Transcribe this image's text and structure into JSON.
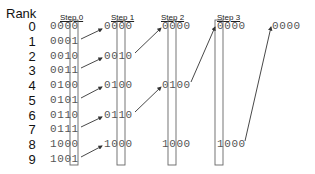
{
  "diagram": {
    "title": "Rank",
    "ranks": [
      "0",
      "1",
      "2",
      "3",
      "4",
      "5",
      "6",
      "7",
      "8",
      "9"
    ],
    "steps": [
      {
        "label": "Step 0",
        "values": [
          "0000",
          "0001",
          "0010",
          "0011",
          "0100",
          "0101",
          "0110",
          "0111",
          "1000",
          "1001"
        ],
        "highlight_bit_index": 3
      },
      {
        "label": "Step 1",
        "values": [
          "0000",
          "0010",
          "0100",
          "0110",
          "1000"
        ],
        "highlight_bit_index": 2
      },
      {
        "label": "Step 2",
        "values": [
          "0000",
          "0100",
          "1000"
        ],
        "highlight_bit_index": 1
      },
      {
        "label": "Step 3",
        "values": [
          "0000",
          "1000"
        ],
        "highlight_bit_index": 0
      }
    ],
    "final": {
      "values": [
        "0000"
      ]
    },
    "colors": {
      "text": "#555555",
      "box": "#666666",
      "arrow": "#333333"
    }
  }
}
